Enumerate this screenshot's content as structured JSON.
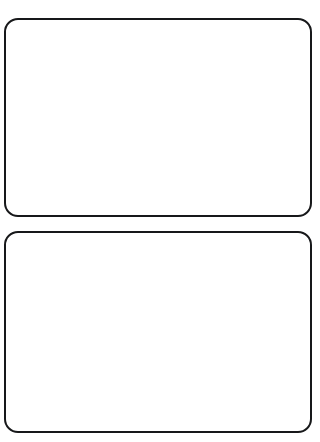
{
  "page": {
    "background_color": "#ffffff",
    "width": 320,
    "height": 442
  },
  "style": {
    "stroke_color": "#17181a",
    "stroke_width_px": 2.5,
    "corner_radius_px": 14,
    "fill_color": "#ffffff"
  },
  "cards": [
    {
      "index": "1",
      "label": "",
      "content": "",
      "x": 4,
      "y": 18,
      "width": 308,
      "height": 199
    },
    {
      "index": "2",
      "label": "",
      "content": "",
      "x": 4,
      "y": 231,
      "width": 308,
      "height": 202
    }
  ]
}
